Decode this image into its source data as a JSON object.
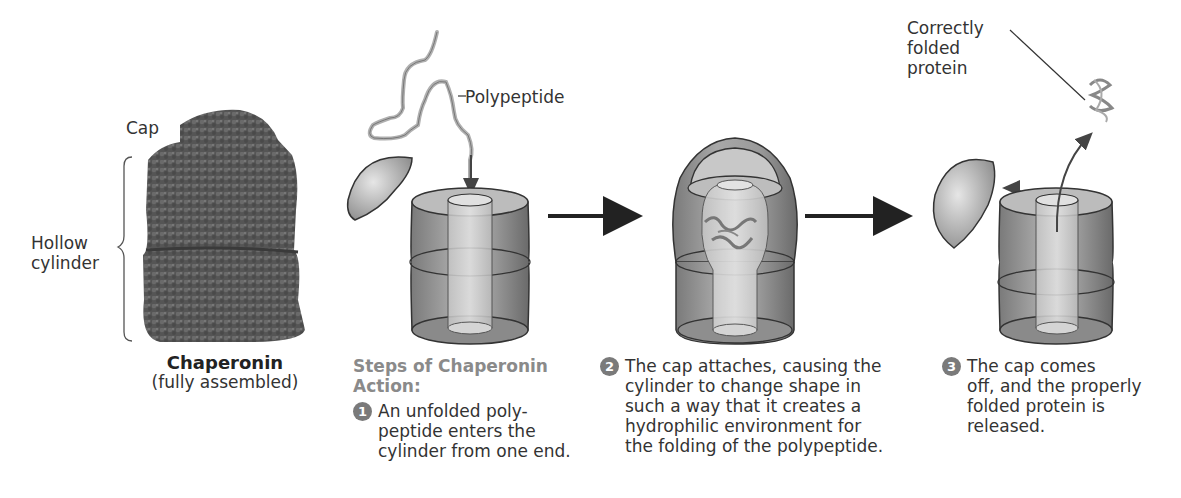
{
  "figure": {
    "chaperonin_image": {
      "label_cap": "Cap",
      "label_hollow_cylinder_line1": "Hollow",
      "label_hollow_cylinder_line2": "cylinder",
      "title": "Chaperonin",
      "subtitle": "(fully assembled)"
    },
    "labels": {
      "polypeptide": "Polypeptide",
      "correctly_folded_line1": "Correctly",
      "correctly_folded_line2": "folded",
      "correctly_folded_line3": "protein"
    },
    "steps_heading_line1": "Steps of Chaperonin",
    "steps_heading_line2": "Action:",
    "steps": [
      {
        "number": "1",
        "lines": [
          "An unfolded poly-",
          "peptide enters the",
          "cylinder from one end."
        ]
      },
      {
        "number": "2",
        "lines": [
          "The cap attaches, causing the",
          "cylinder to change shape in",
          "such a way that it creates a",
          "hydrophilic environment for",
          "the folding of the polypeptide."
        ]
      },
      {
        "number": "3",
        "lines": [
          "The cap comes",
          "off, and the properly",
          "folded protein is",
          "released."
        ]
      }
    ],
    "colors": {
      "shape_fill": "#9a9a9a",
      "shape_dark": "#6e6e6e",
      "shape_light": "#d8d8d8",
      "outline": "#333333",
      "heading_gray": "#8a8a8a"
    }
  }
}
